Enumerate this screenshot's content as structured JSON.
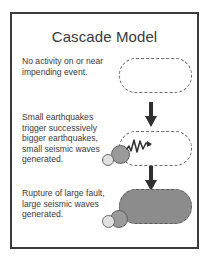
{
  "figure": {
    "title": "Cascade Model",
    "frame_color": "#3b3b3b",
    "background": "#ffffff",
    "text_color": "#3a3a3a"
  },
  "diagram_data": {
    "type": "diagram",
    "title": "Cascade Model",
    "flow_direction": "top-to-bottom",
    "stages": [
      {
        "id": "stage-1",
        "caption": "No activity on or near impending event.",
        "fault_state": "quiescent",
        "fault_fill": "none",
        "fault_outline": "dashed",
        "earthquakes": [],
        "seismic_waves": "none"
      },
      {
        "id": "stage-2",
        "caption": "Small earthquakes trigger successively bigger earthquakes, small seismic waves generated.",
        "fault_state": "partially-triggered",
        "fault_fill": "none",
        "fault_outline": "dashed",
        "earthquakes": [
          {
            "size": "small",
            "color": "#e0e0e0"
          },
          {
            "size": "medium",
            "color": "#9a9a9a"
          }
        ],
        "seismic_waves": "small"
      },
      {
        "id": "stage-3",
        "caption": "Rupture of large fault, large seismic waves generated.",
        "fault_state": "ruptured",
        "fault_fill": "#8c8c8c",
        "fault_outline": "dashed",
        "earthquakes": [
          {
            "size": "small",
            "color": "#e0e0e0"
          },
          {
            "size": "medium",
            "color": "#9a9a9a"
          }
        ],
        "seismic_waves": "large"
      }
    ],
    "connectors": [
      {
        "from": "stage-1",
        "to": "stage-2",
        "glyph": "down-arrow"
      },
      {
        "from": "stage-2",
        "to": "stage-3",
        "glyph": "down-arrow"
      }
    ]
  }
}
